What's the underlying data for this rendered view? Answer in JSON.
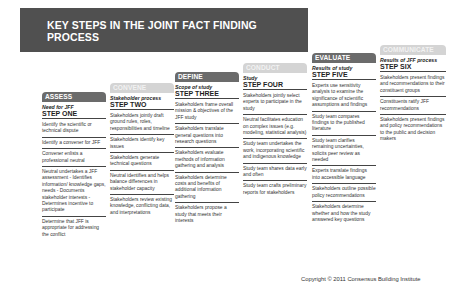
{
  "title": "KEY STEPS IN THE JOINT FACT FINDING PROCESS",
  "columns": [
    {
      "tab": "ASSESS",
      "subtitle": "Need for JFF",
      "step": "STEP ONE",
      "items": [
        "Identify the scientific or technical dispute",
        "Identify a convener for JFF",
        "Convener enlists a professional neutral",
        "Neutral undertakes a JFF assessment - Identifies information/ knowledge gaps, needs - Documents stakeholder interests - Determines incentive to participate",
        "Determine that JFF is appropriate for addressing the conflict"
      ]
    },
    {
      "tab": "CONVENE",
      "subtitle": "Stakeholder process",
      "step": "STEP TWO",
      "items": [
        "Stakeholders jointly draft ground rules, roles, responsibilities and timeline",
        "Stakeholders identify key issues",
        "Stakeholders generate technical questions",
        "Neutral identifies and helps balance differences in stakeholder capacity",
        "Stakeholders review existing knowledge, conflicting data, and interpretations"
      ]
    },
    {
      "tab": "DEFINE",
      "subtitle": "Scope of study",
      "step": "STEP THREE",
      "items": [
        "Stakeholders frame overall mission & objectives of the JFF study",
        "Stakeholders translate general questions into research questions",
        "Stakeholders evaluate methods of information gathering and analysis",
        "Stakeholders determine costs and benefits of additional information gathering",
        "Stakeholders propose a study that meets their interests"
      ]
    },
    {
      "tab": "CONDUCT",
      "subtitle": "Study",
      "step": "STEP FOUR",
      "items": [
        "Stakeholders jointly select experts to participate in the study",
        "Neutral facilitates education on complex issues (e.g. modeling, statistical analysis)",
        "Study team undertakes the work, incorporating scientific and indigenous knowledge",
        "Study team shares data early and often",
        "Study team crafts preliminary reports for stakeholders"
      ]
    },
    {
      "tab": "EVALUATE",
      "subtitle": "Results of study",
      "step": "STEP FIVE",
      "items": [
        "Experts use sensitivity analysis to examine the significance of scientific assumptions and findings",
        "Study team compares findings to the published literature",
        "Study team clarifies remaining uncertainties, solicits peer review as needed",
        "Experts translate findings into accessible language",
        "Stakeholders outline possible policy recommendations",
        "Stakeholders determine whether and how the study answered key questions"
      ]
    },
    {
      "tab": "COMMUNICATE",
      "subtitle": "Results of JFF process",
      "step": "STEP SIX",
      "items": [
        "Stakeholders present findings and recommendations to their constituent groups",
        "Constituents ratify JFF recommendations",
        "Stakeholders present findings and policy recommendations to the public and decision makers"
      ]
    }
  ],
  "copyright": "Copyright © 2011 Consensus Building Institute"
}
